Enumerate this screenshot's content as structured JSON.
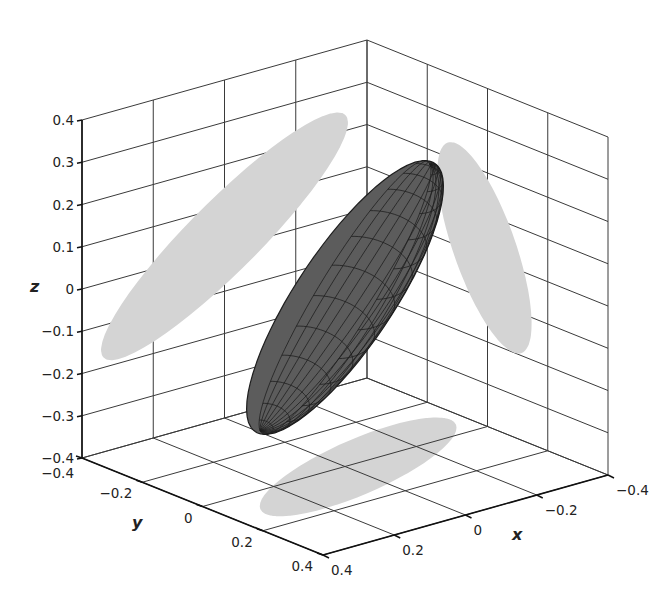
{
  "chart_data": {
    "type": "surface3d",
    "title": "",
    "axes": {
      "x": {
        "label": "x",
        "range": [
          -0.4,
          0.4
        ],
        "ticks": [
          -0.4,
          -0.2,
          0,
          0.2,
          0.4
        ],
        "tick_labels": [
          "−0.4",
          "−0.2",
          "0",
          "0.2",
          "0.4"
        ]
      },
      "y": {
        "label": "y",
        "range": [
          -0.4,
          0.4
        ],
        "ticks": [
          -0.4,
          -0.2,
          0,
          0.2,
          0.4
        ],
        "tick_labels": [
          "−0.4",
          "−0.2",
          "0",
          "0.2",
          "0.4"
        ]
      },
      "z": {
        "label": "z",
        "range": [
          -0.4,
          0.4
        ],
        "ticks": [
          -0.4,
          -0.3,
          -0.2,
          -0.1,
          0,
          0.1,
          0.2,
          0.3,
          0.4
        ],
        "tick_labels": [
          "−0.4",
          "−0.3",
          "−0.2",
          "−0.1",
          "0",
          "0.1",
          "0.2",
          "0.3",
          "0.4"
        ]
      }
    },
    "grid": true,
    "legend": null,
    "ellipsoid": {
      "center": [
        0,
        0,
        0
      ],
      "approx_extent": {
        "x": [
          -0.14,
          0.14
        ],
        "y": [
          -0.36,
          0.3
        ],
        "z": [
          -0.2,
          0.2
        ]
      },
      "color": "#5c5c5c",
      "mesh_color": "#1f1f1f"
    },
    "projections": {
      "color": "#d4d4d4",
      "wall_yz": {
        "approx_y": [
          -0.38,
          0.3
        ],
        "approx_z": [
          -0.22,
          0.28
        ]
      },
      "wall_xz": {
        "approx_x": [
          -0.17,
          0.14
        ],
        "approx_z": [
          -0.27,
          0.29
        ]
      },
      "floor_xy": {
        "approx_x": [
          -0.17,
          0.14
        ],
        "approx_y": [
          -0.27,
          0.3
        ]
      }
    }
  },
  "labels": {
    "x_axis": "x",
    "y_axis": "y",
    "z_axis": "z"
  }
}
